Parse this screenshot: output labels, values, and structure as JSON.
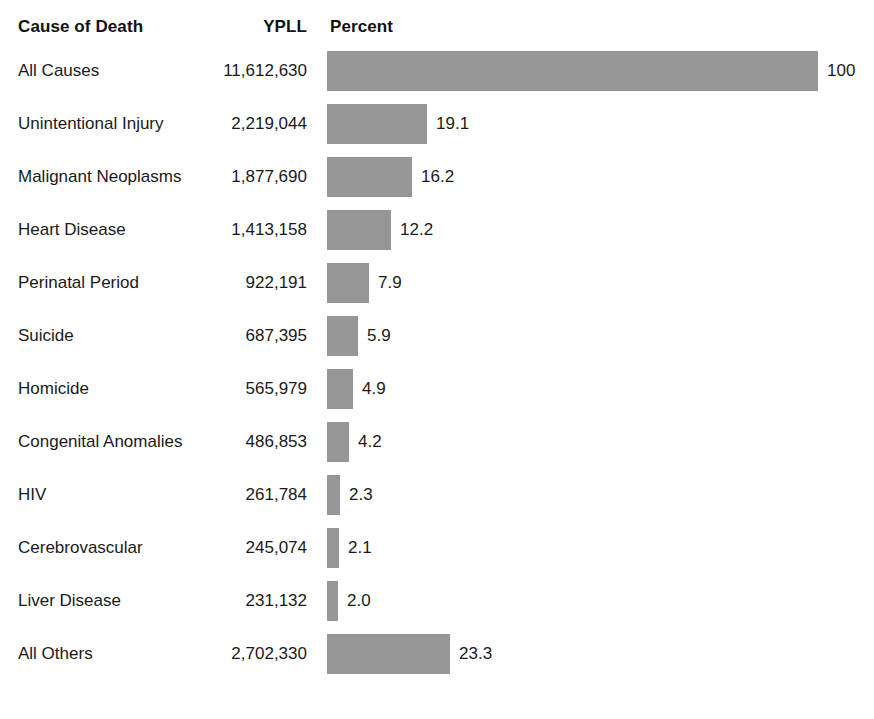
{
  "figure": {
    "background_color": "#ffffff",
    "bar_color": "#969696",
    "text_color": "#1a1a1a"
  },
  "headers": {
    "cause": "Cause of Death",
    "ypll": "YPLL",
    "percent": "Percent"
  },
  "rows": [
    {
      "cause": "All Causes",
      "ypll": "11,612,630",
      "percent": "100",
      "value": 100.0,
      "bar_px": 491
    },
    {
      "cause": "Unintentional Injury",
      "ypll": "2,219,044",
      "percent": "19.1",
      "value": 19.1,
      "bar_px": 100
    },
    {
      "cause": "Malignant Neoplasms",
      "ypll": "1,877,690",
      "percent": "16.2",
      "value": 16.2,
      "bar_px": 85
    },
    {
      "cause": "Heart Disease",
      "ypll": "1,413,158",
      "percent": "12.2",
      "value": 12.2,
      "bar_px": 64
    },
    {
      "cause": "Perinatal Period",
      "ypll": "922,191",
      "percent": "7.9",
      "value": 7.9,
      "bar_px": 42
    },
    {
      "cause": "Suicide",
      "ypll": "687,395",
      "percent": "5.9",
      "value": 5.9,
      "bar_px": 31
    },
    {
      "cause": "Homicide",
      "ypll": "565,979",
      "percent": "4.9",
      "value": 4.9,
      "bar_px": 26
    },
    {
      "cause": "Congenital Anomalies",
      "ypll": "486,853",
      "percent": "4.2",
      "value": 4.2,
      "bar_px": 22
    },
    {
      "cause": "HIV",
      "ypll": "261,784",
      "percent": "2.3",
      "value": 2.3,
      "bar_px": 13
    },
    {
      "cause": "Cerebrovascular",
      "ypll": "245,074",
      "percent": "2.1",
      "value": 2.1,
      "bar_px": 12
    },
    {
      "cause": "Liver Disease",
      "ypll": "231,132",
      "percent": "2.0",
      "value": 2.0,
      "bar_px": 11
    },
    {
      "cause": "All Others",
      "ypll": "2,702,330",
      "percent": "23.3",
      "value": 23.3,
      "bar_px": 123
    }
  ],
  "chart_data": {
    "type": "bar",
    "title": "",
    "orientation": "horizontal",
    "xlabel": "Percent",
    "ylabel": "Cause of Death",
    "categories": [
      "All Causes",
      "Unintentional Injury",
      "Malignant Neoplasms",
      "Heart Disease",
      "Perinatal Period",
      "Suicide",
      "Homicide",
      "Congenital Anomalies",
      "HIV",
      "Cerebrovascular",
      "Liver Disease",
      "All Others"
    ],
    "values": [
      100,
      19.1,
      16.2,
      12.2,
      7.9,
      5.9,
      4.9,
      4.2,
      2.3,
      2.1,
      2.0,
      23.3
    ],
    "series": [
      {
        "name": "Percent",
        "values": [
          100,
          19.1,
          16.2,
          12.2,
          7.9,
          5.9,
          4.9,
          4.2,
          2.3,
          2.1,
          2.0,
          23.3
        ]
      },
      {
        "name": "YPLL",
        "values": [
          11612630,
          2219044,
          1877690,
          1413158,
          922191,
          687395,
          565979,
          486853,
          261784,
          245074,
          231132,
          2702330
        ]
      }
    ],
    "data_labels": [
      "100",
      "19.1",
      "16.2",
      "12.2",
      "7.9",
      "5.9",
      "4.9",
      "4.2",
      "2.3",
      "2.1",
      "2.0",
      "23.3"
    ],
    "xlim": [
      0,
      100
    ],
    "grid": false,
    "legend": "none",
    "bar_color": "#969696"
  }
}
